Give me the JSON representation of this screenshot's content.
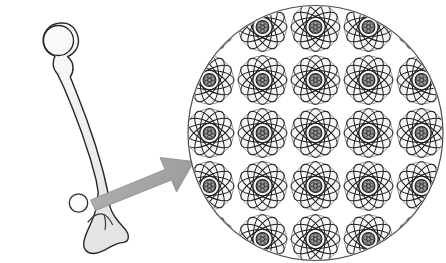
{
  "illustration": {
    "title": "Bone magnified to atomic structure",
    "type": "scientific-diagram",
    "canvas": {
      "width": 446,
      "height": 263,
      "background": "#ffffff"
    }
  },
  "bone": {
    "label": "Femur bone",
    "anatomy": "femur",
    "fill_top": "#f4f4f4",
    "fill_bottom": "#e9e9e9",
    "outline_color": "#262626",
    "outline_width": 1.4,
    "bounds": {
      "x": 28,
      "y": 22,
      "width": 100,
      "height": 232
    },
    "outline_path": "M 66.5 23.4 C 59.0 22.2 51.6 24.2 47.2 29.1 C 42.6 34.2 41.9 41.6 44.6 47.3 C 46.7 51.8 50.6 54.9 55.0 56.2 C 53.8 58.6 53.1 61.3 53.2 64.0 C 53.3 67.6 54.8 70.9 57.2 73.4 L 63.6 86.8 L 72.4 108.0 L 82.0 133.6 L 90.4 159.0 L 96.2 180.4 L 98.2 192.4 L 97.2 203.0 C 96.0 210.6 93.6 217.6 90.6 224.0 C 88.0 229.6 85.4 234.8 84.2 240.2 C 83.2 244.8 83.8 249.0 86.8 251.4 C 89.8 253.8 94.2 253.8 98.4 252.6 C 103.0 251.2 107.2 248.6 111.4 246.4 C 115.2 244.4 119.0 242.8 122.6 242.6 C 125.6 242.4 127.6 241.0 128.2 238.4 C 128.8 235.6 127.6 232.6 125.8 230.2 C 123.2 226.6 119.8 223.4 117.0 219.8 C 113.4 215.2 110.6 210.0 109.4 204.2 L 107.4 190.0 L 103.0 171.0 L 95.4 145.0 L 86.2 118.0 L 76.8 93.4 L 70.2 76.8 C 72.2 74.0 73.2 70.6 73.0 67.2 C 72.8 63.0 70.8 59.2 67.6 56.6 C 71.0 55.2 74.0 52.8 76.0 49.6 C 78.8 45.0 79.2 39.2 77.2 34.2 C 75.2 29.0 71.4 24.8 66.5 23.4 Z",
    "head_circle": {
      "cx": 58.5,
      "cy": 40.5,
      "r": 15.0,
      "label": "Femoral head"
    },
    "marker_circle": {
      "cx": 78.5,
      "cy": 203.0,
      "r": 9.2,
      "label": "Sample region marker"
    },
    "condyle_marks": [
      "M 88.0 222.0 C 92.5 216.5 98.5 212.5 104.0 214.5 C 108.0 216.0 110.0 220.0 112.5 224.5",
      "M 104.0 214.5 C 105.5 219.0 106.0 224.5 105.0 229.5"
    ]
  },
  "arrow": {
    "label": "Magnification arrow",
    "direction": "up-right",
    "shaft_color": "#a8a8a8",
    "head_color": "#9a9a9a",
    "edge_color": "#8a8a8a",
    "from": {
      "x": 90,
      "y": 203
    },
    "to": {
      "x": 194,
      "y": 160
    },
    "path": "M 90.5 200.0 L 165.0 169.5 L 160.0 157.5 L 194.0 161.5 L 176.5 192.0 L 171.5 180.0 L 95.5 210.5 Z"
  },
  "magnifier": {
    "label": "Magnified atomic structure",
    "circle": {
      "cx": 315.5,
      "cy": 133.0,
      "r": 127.5
    },
    "outline_color": "#4a4a4a",
    "outline_width": 1.2,
    "fill": "#ffffff",
    "content_description": "Repeating lattice of Bohr-model atoms"
  },
  "atom": {
    "label": "Atom",
    "orbit_count": 6,
    "orbit_rx": 24.5,
    "orbit_ry": 9.5,
    "orbit_color": "#1c1c1c",
    "orbit_width": 1.0,
    "shell_circle_r": 24.0,
    "shell_color": "#8c8c8c",
    "shell_fill": "#f7f7f7",
    "nucleus_r": 6.4,
    "nucleus_fill": "#9e9e9e",
    "nucleus_stroke": "#1c1c1c",
    "nucleus_detail_count": 7
  },
  "lattice": {
    "label": "Atom lattice grid",
    "columns": 7,
    "rows": 7,
    "spacing_x": 53,
    "spacing_y": 53,
    "origin_x": 315.5,
    "origin_y": 133.0
  }
}
